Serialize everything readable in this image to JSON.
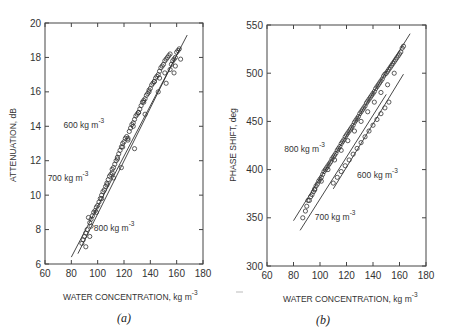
{
  "chart_data": [
    {
      "type": "scatter",
      "panel": "a",
      "caption": "(a)",
      "xlabel": "WATER CONCENTRATION, kg m",
      "xlabel_sup": "-3",
      "ylabel": "ATTENUATION, dB",
      "xlim": [
        60,
        180
      ],
      "ylim": [
        6,
        20
      ],
      "xticks": [
        "60",
        "80",
        "100",
        "120",
        "140",
        "160",
        "180"
      ],
      "yticks": [
        "6",
        "8",
        "10",
        "12",
        "14",
        "16",
        "18",
        "20"
      ],
      "xtick_values": [
        60,
        80,
        100,
        120,
        140,
        160,
        180
      ],
      "ytick_values": [
        6,
        8,
        10,
        12,
        14,
        16,
        18,
        20
      ],
      "annotations": [
        {
          "text": "600 kg m",
          "sup": "-3",
          "x": 74,
          "y": 13.9
        },
        {
          "text": "700 kg m",
          "sup": "-3",
          "x": 62,
          "y": 10.8
        },
        {
          "text": "800 kg m",
          "sup": "-3",
          "x": 97,
          "y": 7.9
        }
      ],
      "fit_lines": [
        {
          "name": "upper",
          "x": [
            80,
            168
          ],
          "y": [
            6.4,
            19.3
          ]
        },
        {
          "name": "lower",
          "x": [
            85,
            163
          ],
          "y": [
            6.6,
            18.6
          ]
        }
      ],
      "series": [
        {
          "name": "measurements",
          "x": [
            88,
            89,
            90,
            91,
            92,
            93,
            94,
            95,
            96,
            97,
            98,
            99,
            100,
            101,
            102,
            103,
            104,
            105,
            106,
            107,
            108,
            109,
            110,
            111,
            112,
            113,
            114,
            115,
            116,
            117,
            118,
            119,
            120,
            121,
            122,
            123,
            124,
            125,
            126,
            127,
            128,
            129,
            130,
            131,
            132,
            133,
            134,
            135,
            136,
            137,
            138,
            139,
            140,
            141,
            142,
            143,
            144,
            145,
            146,
            147,
            148,
            149,
            150,
            151,
            152,
            153,
            154,
            155,
            156,
            157,
            158,
            159,
            160,
            161,
            162,
            163,
            91,
            95,
            99,
            103,
            107,
            111,
            115,
            119,
            123,
            127,
            131,
            135,
            139,
            143,
            147,
            151,
            155,
            159,
            94,
            112,
            118,
            128,
            136,
            146,
            152,
            158
          ],
          "y": [
            7.2,
            7.4,
            7.6,
            7.8,
            8.0,
            8.7,
            8.4,
            8.6,
            8.8,
            9.0,
            9.1,
            9.3,
            9.4,
            9.6,
            9.8,
            10.0,
            10.2,
            10.3,
            10.5,
            10.7,
            10.9,
            11.1,
            11.2,
            11.5,
            11.6,
            11.8,
            12.0,
            12.2,
            12.4,
            12.6,
            12.8,
            13.0,
            13.1,
            13.3,
            13.4,
            13.3,
            13.7,
            13.9,
            14.1,
            14.2,
            14.4,
            14.6,
            14.7,
            14.8,
            15.0,
            15.2,
            15.4,
            15.5,
            15.6,
            15.8,
            15.9,
            16.1,
            16.2,
            16.4,
            16.5,
            16.6,
            16.8,
            16.9,
            17.0,
            17.2,
            17.4,
            17.5,
            17.6,
            17.8,
            17.9,
            18.0,
            18.1,
            18.2,
            17.6,
            17.8,
            17.9,
            18.0,
            18.3,
            18.4,
            18.5,
            17.9,
            7.0,
            8.2,
            9.0,
            9.8,
            10.6,
            11.3,
            12.1,
            12.8,
            13.2,
            14.0,
            14.8,
            15.4,
            16.0,
            16.6,
            16.8,
            17.1,
            17.3,
            17.5,
            7.6,
            11.0,
            11.6,
            12.7,
            14.7,
            16.0,
            16.5,
            17.1
          ]
        }
      ]
    },
    {
      "type": "scatter",
      "panel": "b",
      "caption": "(b)",
      "xlabel": "WATER CONCENTRATION, kg m",
      "xlabel_sup": "-3",
      "ylabel": "PHASE SHIFT, deg",
      "xlim": [
        60,
        180
      ],
      "ylim": [
        300,
        550
      ],
      "xticks": [
        "60",
        "80",
        "100",
        "120",
        "140",
        "160",
        "180"
      ],
      "yticks": [
        "300",
        "350",
        "400",
        "450",
        "500",
        "550"
      ],
      "xtick_values": [
        60,
        80,
        100,
        120,
        140,
        160,
        180
      ],
      "ytick_values": [
        300,
        350,
        400,
        450,
        500,
        550
      ],
      "annotations": [
        {
          "text": "800 kg m",
          "sup": "-3",
          "x": 73,
          "y": 418
        },
        {
          "text": "600 kg m",
          "sup": "-3",
          "x": 128,
          "y": 391
        },
        {
          "text": "700 kg m",
          "sup": "-3",
          "x": 96,
          "y": 348
        }
      ],
      "fit_lines": [
        {
          "name": "800 kg m-3",
          "x": [
            80,
            168
          ],
          "y": [
            347,
            541
          ]
        },
        {
          "name": "700 kg m-3",
          "x": [
            85,
            150
          ],
          "y": [
            337,
            478
          ]
        },
        {
          "name": "600 kg m-3",
          "x": [
            110,
            163
          ],
          "y": [
            380,
            499
          ]
        }
      ],
      "series": [
        {
          "name": "measurements",
          "x": [
            87,
            89,
            90,
            92,
            93,
            94,
            95,
            96,
            97,
            98,
            99,
            100,
            101,
            102,
            103,
            104,
            105,
            106,
            107,
            108,
            109,
            110,
            111,
            112,
            113,
            114,
            115,
            116,
            117,
            118,
            119,
            120,
            121,
            122,
            123,
            124,
            125,
            126,
            127,
            128,
            129,
            130,
            131,
            132,
            133,
            134,
            135,
            136,
            137,
            138,
            139,
            140,
            141,
            142,
            143,
            144,
            145,
            146,
            147,
            148,
            149,
            150,
            151,
            152,
            153,
            154,
            155,
            156,
            157,
            158,
            159,
            160,
            161,
            162,
            163,
            110,
            113,
            116,
            119,
            122,
            125,
            128,
            131,
            134,
            137,
            140,
            143,
            146,
            149,
            152,
            91,
            96,
            101,
            106,
            111,
            116,
            121,
            126,
            131,
            136,
            141,
            146,
            151,
            156
          ],
          "y": [
            350,
            357,
            362,
            368,
            372,
            374,
            377,
            380,
            383,
            385,
            388,
            390,
            392,
            395,
            398,
            400,
            402,
            404,
            406,
            408,
            411,
            413,
            415,
            417,
            420,
            422,
            424,
            427,
            429,
            431,
            434,
            436,
            438,
            440,
            442,
            444,
            446,
            449,
            451,
            453,
            455,
            458,
            460,
            462,
            464,
            466,
            469,
            471,
            473,
            475,
            477,
            479,
            481,
            484,
            486,
            488,
            490,
            492,
            494,
            497,
            499,
            500,
            502,
            504,
            506,
            508,
            510,
            512,
            514,
            516,
            518,
            520,
            522,
            526,
            528,
            386,
            392,
            398,
            404,
            410,
            416,
            422,
            428,
            434,
            440,
            446,
            452,
            458,
            464,
            470,
            368,
            379,
            388,
            400,
            410,
            420,
            430,
            440,
            450,
            460,
            470,
            480,
            488,
            500
          ]
        }
      ]
    }
  ]
}
